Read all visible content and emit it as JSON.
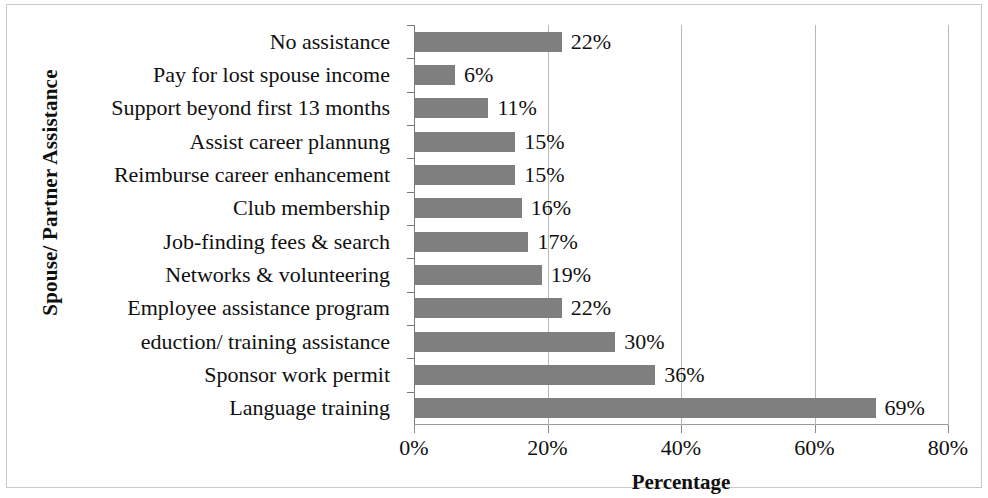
{
  "chart_data": {
    "type": "bar",
    "orientation": "horizontal",
    "title": "",
    "xlabel": "Percentage",
    "ylabel": "Spouse/ Partner Assistance",
    "xlim": [
      0,
      80
    ],
    "xticks": [
      0,
      20,
      40,
      60,
      80
    ],
    "xtick_labels": [
      "0%",
      "20%",
      "40%",
      "60%",
      "80%"
    ],
    "grid": "vertical",
    "legend": "none",
    "bar_color": "#7f7f7f",
    "categories": [
      "No assistance",
      "Pay for lost spouse income",
      "Support beyond first 13 months",
      "Assist career plannung",
      "Reimburse career enhancement",
      "Club membership",
      "Job-finding fees & search",
      "Networks & volunteering",
      "Employee assistance program",
      "eduction/ training assistance",
      "Sponsor work permit",
      "Language training"
    ],
    "values": [
      22,
      6,
      11,
      15,
      15,
      16,
      17,
      19,
      22,
      30,
      36,
      69
    ],
    "value_labels": [
      "22%",
      "6%",
      "11%",
      "15%",
      "15%",
      "16%",
      "17%",
      "19%",
      "22%",
      "30%",
      "36%",
      "69%"
    ]
  }
}
